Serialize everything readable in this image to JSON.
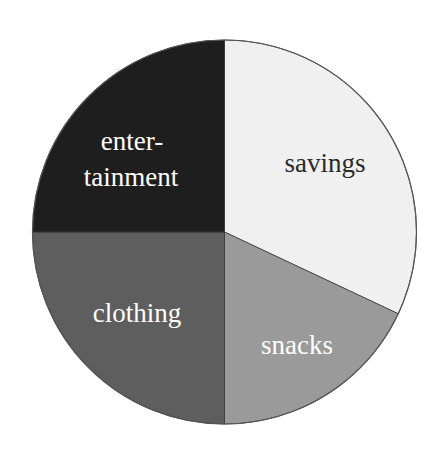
{
  "chart_data": {
    "type": "pie",
    "title": "",
    "categories": [
      "savings",
      "snacks",
      "clothing",
      "entertainment"
    ],
    "values": [
      32,
      18,
      25,
      25
    ],
    "unit": "percent (estimated from slice angles)",
    "start_angle_deg": 90,
    "direction": "clockwise",
    "legend": "none (labels drawn inside slices)",
    "slices": [
      {
        "label": "savings",
        "value": 32,
        "color": "#f0f0f0",
        "label_color": "#2a2a2a",
        "label_lines": [
          "savings"
        ]
      },
      {
        "label": "snacks",
        "value": 18,
        "color": "#9a9a9a",
        "label_color": "#ffffff",
        "label_lines": [
          "snacks"
        ]
      },
      {
        "label": "clothing",
        "value": 25,
        "color": "#5e5e5e",
        "label_color": "#ffffff",
        "label_lines": [
          "clothing"
        ]
      },
      {
        "label": "entertainment",
        "value": 25,
        "color": "#1e1e1e",
        "label_color": "#ffffff",
        "label_lines": [
          "enter-",
          "tainment"
        ]
      }
    ]
  },
  "layout": {
    "center": [
      224.5,
      232
    ],
    "radius": 192,
    "outline_color": "#555555"
  },
  "labels": {
    "savings": "savings",
    "snacks": "snacks",
    "clothing": "clothing",
    "entertainment_line1": "enter-",
    "entertainment_line2": "tainment"
  }
}
